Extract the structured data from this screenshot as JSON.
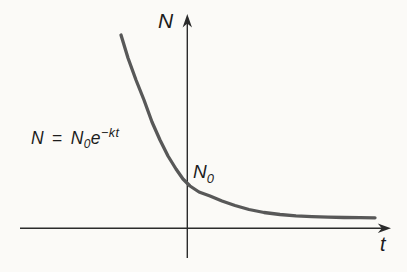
{
  "figure": {
    "colors": {
      "background": "#fbfaf7",
      "axis": "#2b2b2b",
      "curve": "#585858",
      "text": "#1c1c1c"
    },
    "y_axis_label": "N",
    "x_axis_label": "t",
    "intercept_label": {
      "base": "N",
      "sub": "0"
    },
    "equation": {
      "lhs": "N",
      "rel": "=",
      "coeff_base": "N",
      "coeff_sub": "0",
      "exp_base": "e",
      "exponent": "−kt"
    }
  },
  "chart_data": {
    "type": "line",
    "title": "",
    "xlabel": "t",
    "ylabel": "N",
    "x_ticks": [],
    "y_ticks": [],
    "grid": false,
    "legend_position": "none",
    "function": "N = N₀e⁻ᵏᵗ",
    "annotations": [
      {
        "text": "N = N₀e⁻ᵏᵗ",
        "position": "left of curve"
      },
      {
        "text": "N₀",
        "position": "y-intercept of curve"
      }
    ],
    "units_note": "no numeric ticks; t in units of 1/k, N in units of N₀; curve digitized as drawn",
    "series": [
      {
        "name": "N(t)",
        "x": [
          -1.517,
          -1.357,
          -1.174,
          -0.991,
          -0.808,
          -0.625,
          -0.442,
          -0.259,
          -0.098,
          0.062,
          0.268,
          0.519,
          0.794,
          1.092,
          1.412,
          1.755,
          2.121,
          2.487,
          2.854,
          3.22,
          3.586,
          3.952,
          4.295
        ],
        "y": [
          4.421,
          3.895,
          3.391,
          2.934,
          2.43,
          2.018,
          1.652,
          1.355,
          1.126,
          0.966,
          0.828,
          0.737,
          0.622,
          0.519,
          0.428,
          0.359,
          0.314,
          0.284,
          0.265,
          0.252,
          0.245,
          0.24,
          0.238
        ]
      }
    ]
  }
}
